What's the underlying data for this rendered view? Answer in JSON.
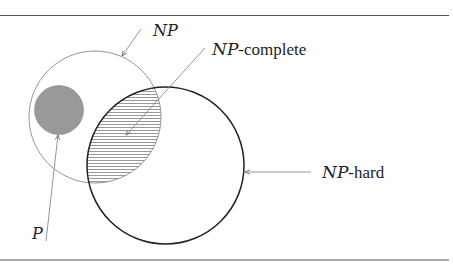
{
  "diagram": {
    "colors": {
      "background": "#ffffff",
      "frame_lines": "#555555",
      "np_circle_stroke": "#8a8a8a",
      "np_hard_circle_stroke": "#222222",
      "p_fill": "#999999",
      "hatch": "#8c8c8c",
      "arrow": "#8a8a8a",
      "text": "#222222"
    },
    "labels": {
      "np": {
        "calligraphic": "NP",
        "suffix": ""
      },
      "np_complete": {
        "calligraphic": "NP",
        "suffix": "-complete"
      },
      "np_hard": {
        "calligraphic": "NP",
        "suffix": "-hard"
      },
      "p": {
        "calligraphic": "P",
        "suffix": ""
      }
    },
    "shapes": {
      "np_circle": {
        "cx": 95,
        "cy": 117,
        "r": 66
      },
      "p_circle": {
        "cx": 59,
        "cy": 110,
        "r": 24.5
      },
      "np_hard_circle": {
        "cx": 165.5,
        "cy": 165.5,
        "r": 78.5
      }
    }
  }
}
